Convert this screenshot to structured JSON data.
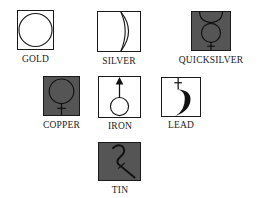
{
  "colors": {
    "light_fill": "#ffffff",
    "dark_fill": "#555555",
    "stroke": "#1a1a1a"
  },
  "symbols": [
    {
      "label": "GOLD",
      "icon": "sun-circle-icon",
      "fill": "light"
    },
    {
      "label": "SILVER",
      "icon": "crescent-moon-icon",
      "fill": "light"
    },
    {
      "label": "QUICKSILVER",
      "icon": "mercury-icon",
      "fill": "dark"
    },
    {
      "label": "COPPER",
      "icon": "venus-icon",
      "fill": "dark"
    },
    {
      "label": "IRON",
      "icon": "mars-icon",
      "fill": "light"
    },
    {
      "label": "LEAD",
      "icon": "saturn-icon",
      "fill": "light"
    },
    {
      "label": "TIN",
      "icon": "jupiter-icon",
      "fill": "dark"
    }
  ]
}
